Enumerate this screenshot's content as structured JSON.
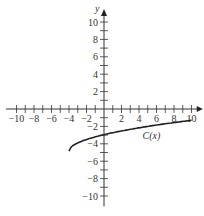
{
  "chart_data": {
    "type": "line",
    "title": "",
    "xlabel": "x",
    "ylabel": "y",
    "xlim": [
      -10,
      10
    ],
    "ylim": [
      -10,
      10
    ],
    "grid": false,
    "x_tick_labels": [
      "-10",
      "-8",
      "-6",
      "-4",
      "-2",
      "2",
      "4",
      "6",
      "8",
      "10"
    ],
    "y_tick_labels": [
      "10",
      "8",
      "6",
      "4",
      "2",
      "-2",
      "-4",
      "-6",
      "-8",
      "-10"
    ],
    "series": [
      {
        "name": "C(x)",
        "label": "C(x)",
        "x": [
          -4,
          -3.5,
          -3,
          -2,
          -1,
          0,
          1,
          2,
          4,
          6,
          8,
          10
        ],
        "y": [
          -4.8,
          -4.3,
          -4.0,
          -3.6,
          -3.3,
          -3.0,
          -2.8,
          -2.6,
          -2.2,
          -1.9,
          -1.6,
          -1.3
        ]
      }
    ],
    "annotations": [
      {
        "text": "C(x)",
        "x": 4,
        "y": -3
      }
    ]
  }
}
